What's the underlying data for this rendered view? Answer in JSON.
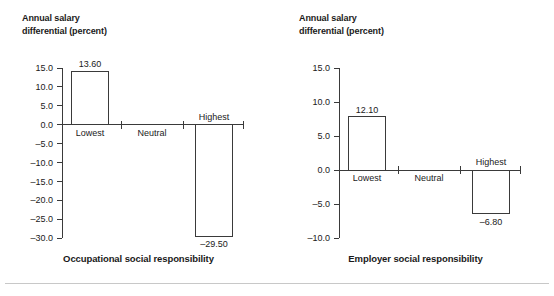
{
  "figure": {
    "background_color": "#ffffff",
    "bar_edge_color": "#3a3a3a",
    "bar_fill_color": "#ffffff",
    "axis_color": "#3a3a3a",
    "rule_color": "#c8c8c8"
  },
  "panels": [
    {
      "id": "occupational",
      "axis_title": "Annual salary\ndifferential (percent)",
      "caption": "Occupational social responsibility"
    },
    {
      "id": "employer",
      "axis_title": "Annual salary\ndifferential (percent)",
      "caption": "Employer social responsibility"
    }
  ],
  "chart_data": [
    {
      "type": "bar",
      "title": "Occupational social responsibility",
      "xlabel": "",
      "ylabel": "Annual salary differential (percent)",
      "categories": [
        "Lowest",
        "Neutral",
        "Highest"
      ],
      "values": [
        13.6,
        null,
        -29.5
      ],
      "value_labels": [
        "13.60",
        "",
        "–29.50"
      ],
      "drawn_values": [
        14.1,
        null,
        -29.5
      ],
      "ylim": [
        -30.0,
        15.0
      ],
      "yticks": [
        15.0,
        10.0,
        5.0,
        0.0,
        -5.0,
        -10.0,
        -15.0,
        -20.0,
        -25.0,
        -30.0
      ],
      "ytick_labels": [
        "15.0",
        "10.0",
        "5.0",
        "0.0",
        "–5.0",
        "–10.0",
        "–15.0",
        "–20.0",
        "–25.0",
        "–30.0"
      ],
      "grid": false,
      "legend": null
    },
    {
      "type": "bar",
      "title": "Employer social responsibility",
      "xlabel": "",
      "ylabel": "Annual salary differential (percent)",
      "categories": [
        "Lowest",
        "Neutral",
        "Highest"
      ],
      "values": [
        12.1,
        null,
        -6.8
      ],
      "value_labels": [
        "12.10",
        "",
        "–6.80"
      ],
      "drawn_values": [
        7.8,
        null,
        -6.4
      ],
      "ylim": [
        -10.0,
        15.0
      ],
      "yticks": [
        15.0,
        10.0,
        5.0,
        0.0,
        -5.0,
        -10.0
      ],
      "ytick_labels": [
        "15.0",
        "10.0",
        "5.0",
        "0.0",
        "–5.0",
        "–10.0"
      ],
      "grid": false,
      "legend": null
    }
  ]
}
